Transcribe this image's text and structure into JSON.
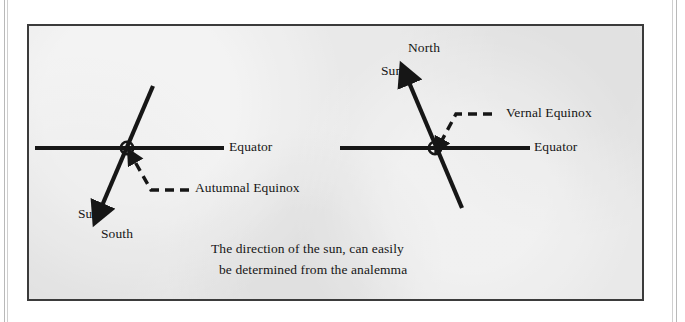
{
  "figure": {
    "background_color": "#e9e9e9",
    "border_color": "#3b3b3b",
    "ink_color": "#161616",
    "caption": {
      "line1": "The direction of the sun, can easily",
      "line2": "be determined from the analemma"
    },
    "panels": [
      {
        "id": "autumnal-equinox-panel",
        "name": "left-panel",
        "equator_label": "Equator",
        "equinox_label": "Autumnal Equinox",
        "sun_label": "Sun",
        "pole_label": "South",
        "sun_arrow_direction": "down-left",
        "equator_y": 146,
        "equator_x1": 33,
        "equator_x2": 222,
        "origin_x": 125,
        "origin_y": 146
      },
      {
        "id": "vernal-equinox-panel",
        "name": "right-panel",
        "equator_label": "Equator",
        "equinox_label": "Vernal Equinox",
        "sun_label": "Sun",
        "pole_label": "North",
        "sun_arrow_direction": "up-left",
        "equator_y": 146,
        "equator_x1": 338,
        "equator_x2": 528,
        "origin_x": 433,
        "origin_y": 146
      }
    ],
    "markers": {
      "origin_symbol": "sun-symbol-circle-dot"
    }
  }
}
